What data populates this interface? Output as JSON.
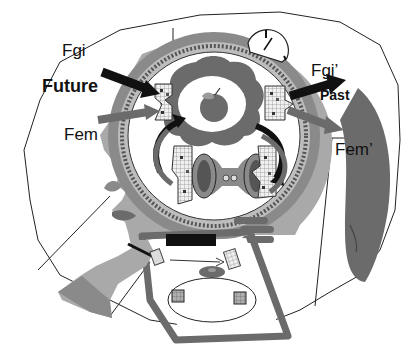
{
  "labels": {
    "fgi": "Fgi",
    "future": "Future",
    "fem": "Fem",
    "fgi_prime": "Fgi’",
    "past": "Past",
    "fem_prime": "Fem’"
  },
  "colors": {
    "skin": "#a9a9a9",
    "dark_gray": "#6b6b6b",
    "mid_gray": "#8a8a8a",
    "black": "#111111",
    "outline": "#222222",
    "background": "#ffffff"
  },
  "elements": {
    "clock": "clock-icon",
    "apple": "apple-icon",
    "pen": "pen-icon",
    "hand": "hand-icon",
    "grid_blocks": 4,
    "cubes": 2
  }
}
